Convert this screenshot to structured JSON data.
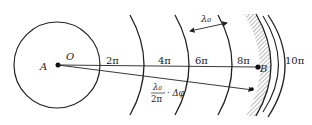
{
  "diagram": {
    "title": "",
    "source": {
      "label_center": "O",
      "label_point": "A"
    },
    "wavefront_phases": [
      "2π",
      "4π",
      "6π",
      "8π",
      "10π"
    ],
    "wavelength_label": "λ₀",
    "path_difference": {
      "numerator": "λ₀",
      "denominator": "2π",
      "suffix": "· Δφ"
    },
    "target_point": "B",
    "colors": {
      "line": "#222222",
      "hatch": "#777777",
      "background": "#ffffff"
    }
  }
}
